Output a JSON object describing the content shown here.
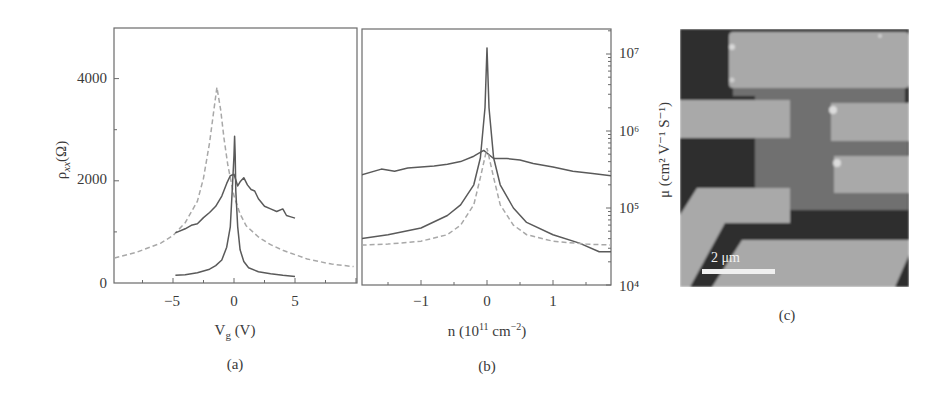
{
  "chart_data": [
    {
      "panel": "(a)",
      "type": "line",
      "title": "",
      "xlabel": "V_g (V)",
      "ylabel": "ρ_xx(Ω)",
      "xlim": [
        -10,
        10
      ],
      "ylim": [
        0,
        5000
      ],
      "xticks": [
        -5,
        0,
        5
      ],
      "xtick_labels": [
        "−5",
        "0",
        "5"
      ],
      "yticks": [
        0,
        2000,
        4000
      ],
      "ytick_labels": [
        "0",
        "2000",
        "4000"
      ],
      "grid": false,
      "series": [
        {
          "name": "dashed (before annealing)",
          "style": "dashed",
          "x": [
            -9.8,
            -8,
            -6,
            -5,
            -4,
            -3,
            -2.5,
            -2,
            -1.7,
            -1.4,
            -1.1,
            -0.8,
            -0.5,
            0,
            0.5,
            1,
            2,
            3,
            4,
            6,
            8,
            9.8
          ],
          "y": [
            490,
            600,
            780,
            930,
            1180,
            1600,
            2050,
            2750,
            3300,
            3830,
            3400,
            2800,
            2300,
            1700,
            1350,
            1120,
            900,
            750,
            640,
            470,
            370,
            320
          ]
        },
        {
          "name": "solid broad (before suspension)",
          "style": "solid",
          "x": [
            -4.8,
            -4,
            -3.5,
            -3,
            -2.5,
            -2,
            -1.5,
            -1,
            -0.6,
            -0.3,
            0,
            0.3,
            0.5,
            0.8,
            1.1,
            1.4,
            1.7,
            2,
            2.5,
            3,
            3.5,
            4,
            4.3,
            4.6,
            5
          ],
          "y": [
            980,
            1060,
            1130,
            1160,
            1280,
            1380,
            1500,
            1700,
            1950,
            2100,
            2130,
            1900,
            1980,
            2060,
            1920,
            1830,
            1800,
            1650,
            1500,
            1450,
            1400,
            1450,
            1320,
            1300,
            1270
          ]
        },
        {
          "name": "solid narrow (suspended, annealed)",
          "style": "solid",
          "x": [
            -4.8,
            -4,
            -3,
            -2,
            -1.5,
            -1,
            -0.6,
            -0.3,
            -0.15,
            0,
            0.05,
            0.1,
            0.15,
            0.3,
            0.5,
            0.8,
            1.2,
            2,
            3,
            4,
            5
          ],
          "y": [
            150,
            160,
            200,
            270,
            340,
            450,
            700,
            1100,
            1800,
            2500,
            2870,
            2500,
            1800,
            1100,
            650,
            420,
            300,
            220,
            180,
            150,
            130
          ]
        }
      ],
      "caption": "(a)"
    },
    {
      "panel": "(b)",
      "type": "line",
      "title": "",
      "xlabel": "n (10¹¹ cm⁻²)",
      "ylabel": "μ (cm² V⁻¹ S⁻¹)",
      "yaxis_scale": "log",
      "yaxis_side": "right",
      "xlim": [
        -1.9,
        1.9
      ],
      "ylim": [
        10000,
        20000000
      ],
      "xticks": [
        -1,
        0,
        1
      ],
      "xtick_labels": [
        "−1",
        "0",
        "1"
      ],
      "yticks": [
        10000,
        100000,
        1000000,
        10000000
      ],
      "ytick_labels": [
        "10⁴",
        "10⁵",
        "10⁶",
        "10⁷"
      ],
      "grid": false,
      "series": [
        {
          "name": "solid broad",
          "style": "solid",
          "x": [
            -1.9,
            -1.6,
            -1.4,
            -1.2,
            -1,
            -0.8,
            -0.6,
            -0.4,
            -0.2,
            -0.05,
            0.1,
            0.3,
            0.5,
            0.7,
            1,
            1.3,
            1.6,
            1.9
          ],
          "y": [
            270000,
            320000,
            300000,
            330000,
            340000,
            350000,
            370000,
            400000,
            470000,
            560000,
            440000,
            440000,
            420000,
            380000,
            340000,
            300000,
            280000,
            260000
          ]
        },
        {
          "name": "solid sharp (suspended)",
          "style": "solid",
          "x": [
            -1.9,
            -1.5,
            -1,
            -0.6,
            -0.4,
            -0.2,
            -0.1,
            -0.03,
            0,
            0.03,
            0.1,
            0.2,
            0.4,
            0.6,
            1,
            1.4,
            1.7,
            1.9
          ],
          "y": [
            40000,
            45000,
            55000,
            80000,
            110000,
            200000,
            450000,
            2000000,
            12000000,
            2000000,
            450000,
            200000,
            100000,
            65000,
            45000,
            35000,
            27000,
            27000
          ]
        },
        {
          "name": "dashed",
          "style": "dashed",
          "x": [
            -1.9,
            -1.5,
            -1,
            -0.6,
            -0.4,
            -0.2,
            -0.1,
            0,
            0.1,
            0.2,
            0.4,
            0.6,
            1,
            1.5,
            1.9
          ],
          "y": [
            33000,
            34000,
            37000,
            45000,
            60000,
            110000,
            250000,
            600000,
            250000,
            110000,
            60000,
            45000,
            37000,
            34000,
            33000
          ]
        }
      ],
      "caption": "(b)"
    }
  ],
  "panels": {
    "a": {
      "xlabel_main": "V",
      "xlabel_sub": "g",
      "xlabel_unit": " (V)",
      "ylabel_main": "ρ",
      "ylabel_sub": "xx",
      "ylabel_unit": "(Ω)",
      "caption": "(a)"
    },
    "b": {
      "xlabel_pre": "n (10",
      "xlabel_sup1": "11",
      "xlabel_mid": " cm",
      "xlabel_sup2": "−2",
      "xlabel_post": ")",
      "ylabel": "μ (cm² V⁻¹ S⁻¹)",
      "caption": "(b)"
    },
    "c": {
      "description": "SEM micrograph of suspended graphene device with electrodes",
      "scalebar_label": "2 μm",
      "caption": "(c)",
      "colors": {
        "substrate_dark": "#2f2f2f",
        "electrode_light": "#a9a9a9",
        "graphene_mid": "#6f6f6f"
      }
    }
  }
}
